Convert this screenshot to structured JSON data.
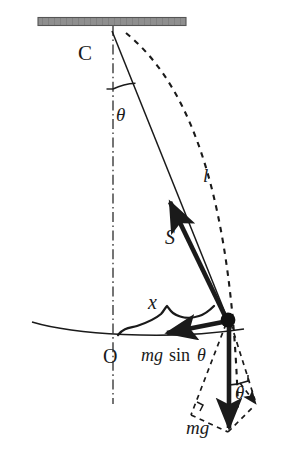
{
  "figure": {
    "background_color": "#ffffff",
    "ink_color": "#1a1a1a",
    "ceiling_color": "#8c8c8c",
    "centerline_color": "#6e6e6e"
  },
  "labels": {
    "pivot": "C",
    "equilibrium": "O",
    "length": "l",
    "tension": "S",
    "displacement": "x",
    "angle_top": "θ",
    "angle_bottom": "θ",
    "restoring_force": "mg sin θ",
    "restoring_force_italic": "mg",
    "restoring_force_upright": "sin",
    "restoring_force_angle": "θ",
    "weight": "mg"
  },
  "elements": [
    {
      "name": "ceiling-support",
      "kind": "hatched-bar",
      "interactable": false
    },
    {
      "name": "pivot-point-c",
      "kind": "point-label",
      "interactable": false
    },
    {
      "name": "vertical-centerline",
      "kind": "dash-dot-line",
      "interactable": false
    },
    {
      "name": "pendulum-string",
      "kind": "solid-line",
      "interactable": false
    },
    {
      "name": "angle-arc-top",
      "kind": "arc",
      "interactable": false
    },
    {
      "name": "length-arc-dashed",
      "kind": "dashed-arc",
      "interactable": false
    },
    {
      "name": "tension-vector-s",
      "kind": "arrow",
      "interactable": false
    },
    {
      "name": "swing-path-arc",
      "kind": "solid-arc",
      "interactable": false
    },
    {
      "name": "displacement-brace-x",
      "kind": "curly-brace",
      "interactable": false
    },
    {
      "name": "restoring-force-vector",
      "kind": "arrow",
      "interactable": false
    },
    {
      "name": "bob-mass",
      "kind": "filled-circle",
      "interactable": false
    },
    {
      "name": "weight-vector-mg",
      "kind": "arrow",
      "interactable": false
    },
    {
      "name": "component-parallelogram",
      "kind": "dashed-lines",
      "interactable": false
    },
    {
      "name": "angle-arc-bottom",
      "kind": "arc",
      "interactable": false
    },
    {
      "name": "radial-component-arrow",
      "kind": "dashed-arrow",
      "interactable": false
    }
  ],
  "geometry": {
    "pivot": {
      "x": 112,
      "y": 31
    },
    "bob": {
      "x": 228,
      "y": 320
    },
    "equilibrium": {
      "x": 113,
      "y": 337
    },
    "ceiling": {
      "x1": 38,
      "x2": 186,
      "y": 21,
      "thickness": 8
    },
    "string_angle_deg": 22
  }
}
